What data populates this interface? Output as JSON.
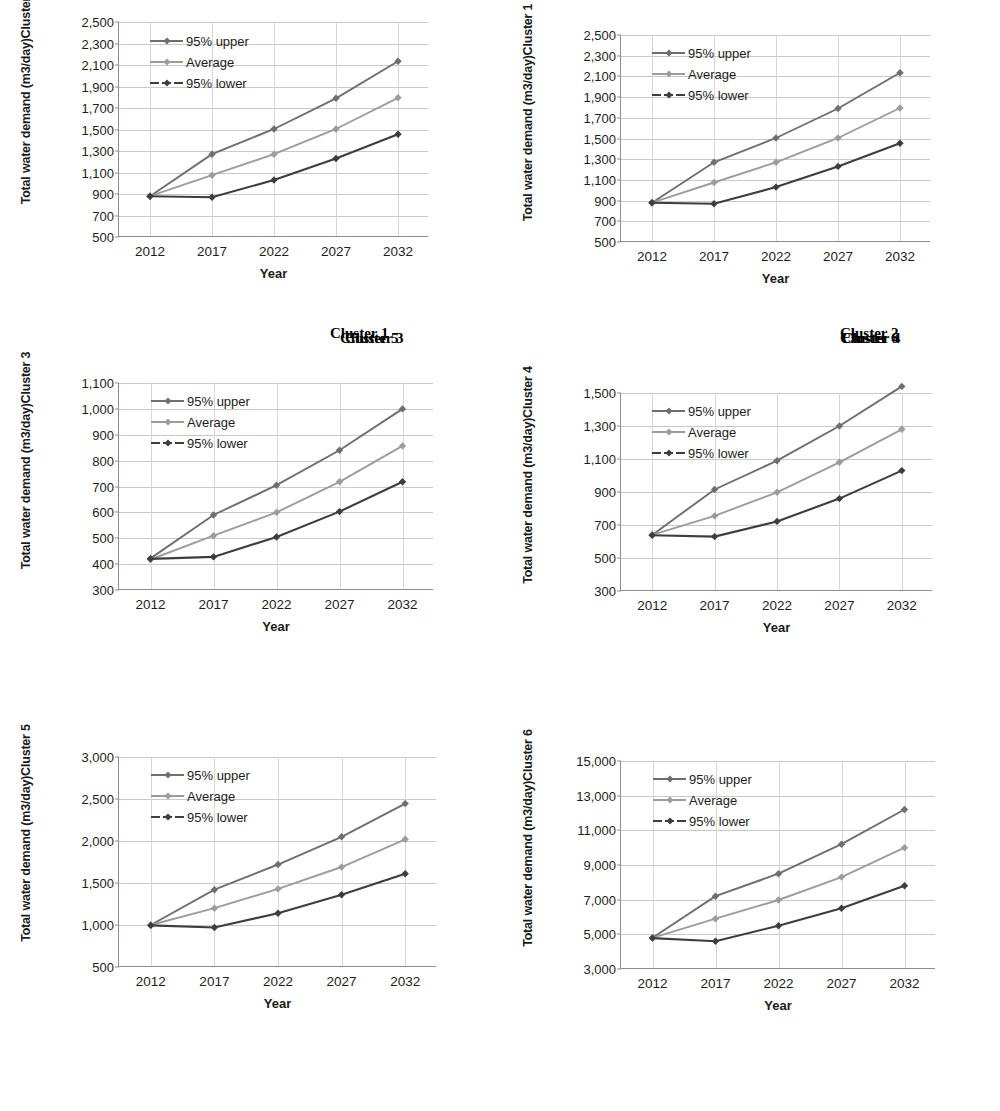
{
  "page": {
    "background": "#ffffff"
  },
  "series_style": {
    "upper_color": "#6e6e6e",
    "average_color": "#9c9c9c",
    "lower_color": "#3d3d3d",
    "gridline_color": "#c9c9c9",
    "axis_color": "#8d8d8d"
  },
  "legend_labels": {
    "upper": "95% upper",
    "average": "Average",
    "lower": "95% lower"
  },
  "axis_titles": {
    "x": "Year",
    "y_prefix": "Total water demand  (m3/day)"
  },
  "chart_data": [
    {
      "id": "chart-1",
      "type": "line",
      "title": "",
      "caption": "Cluster 1",
      "ylabel": "Total water demand  (m3/day)\nCluster 2",
      "ylabel_line1": "Total water demand  (m3/day)",
      "ylabel_line2": "Cluster 2",
      "xlabel": "Year",
      "categories": [
        "2012",
        "2017",
        "2022",
        "2027",
        "2032"
      ],
      "x": [
        2012,
        2017,
        2022,
        2027,
        2032
      ],
      "ylim": [
        500,
        2500
      ],
      "ystep": 200,
      "yticks": [
        "500",
        "700",
        "900",
        "1,100",
        "1,300",
        "1,500",
        "1,700",
        "1,900",
        "2,100",
        "2,300",
        "2,500"
      ],
      "grid": true,
      "legend_position": "top-left",
      "series": [
        {
          "name": "95% upper",
          "values": [
            880,
            1270,
            1505,
            1790,
            2135
          ]
        },
        {
          "name": "Average",
          "values": [
            880,
            1075,
            1270,
            1505,
            1795
          ]
        },
        {
          "name": "95% lower",
          "values": [
            880,
            870,
            1030,
            1230,
            1455
          ]
        }
      ]
    },
    {
      "id": "chart-2",
      "type": "line",
      "title": "",
      "caption": "Cluster 2",
      "ylabel_line1": "Total water demand  (m3/day)",
      "ylabel_line2": "Cluster 1",
      "xlabel": "Year",
      "categories": [
        "2012",
        "2017",
        "2022",
        "2027",
        "2032"
      ],
      "x": [
        2012,
        2017,
        2022,
        2027,
        2032
      ],
      "ylim": [
        500,
        2500
      ],
      "ystep": 200,
      "yticks": [
        "500",
        "700",
        "900",
        "1,100",
        "1,300",
        "1,500",
        "1,700",
        "1,900",
        "2,100",
        "2,300",
        "2,500"
      ],
      "grid": true,
      "legend_position": "top-left",
      "series": [
        {
          "name": "95% upper",
          "values": [
            880,
            1270,
            1505,
            1790,
            2135
          ]
        },
        {
          "name": "Average",
          "values": [
            880,
            1075,
            1270,
            1505,
            1795
          ]
        },
        {
          "name": "95% lower",
          "values": [
            880,
            870,
            1030,
            1230,
            1455
          ]
        }
      ]
    },
    {
      "id": "chart-3",
      "type": "line",
      "title": "",
      "caption": "Cluster 3",
      "ylabel_line1": "Total water demand  (m3/day)",
      "ylabel_line2": "Cluster 3",
      "xlabel": "Year",
      "categories": [
        "2012",
        "2017",
        "2022",
        "2027",
        "2032"
      ],
      "x": [
        2012,
        2017,
        2022,
        2027,
        2032
      ],
      "ylim": [
        300,
        1100
      ],
      "ystep": 100,
      "yticks": [
        "300",
        "400",
        "500",
        "600",
        "700",
        "800",
        "900",
        "1,000",
        "1,100"
      ],
      "grid": true,
      "legend_position": "top-left",
      "series": [
        {
          "name": "95% upper",
          "values": [
            422,
            590,
            705,
            840,
            1000
          ]
        },
        {
          "name": "Average",
          "values": [
            418,
            510,
            600,
            718,
            857
          ]
        },
        {
          "name": "95% lower",
          "values": [
            420,
            428,
            505,
            603,
            718
          ]
        }
      ]
    },
    {
      "id": "chart-4",
      "type": "line",
      "title": "",
      "caption": "Cluster 4",
      "ylabel_line1": "Total water demand  (m3/day)",
      "ylabel_line2": "Cluster 4",
      "xlabel": "Year",
      "categories": [
        "2012",
        "2017",
        "2022",
        "2027",
        "2032"
      ],
      "x": [
        2012,
        2017,
        2022,
        2027,
        2032
      ],
      "ylim": [
        300,
        1500
      ],
      "ystep": 200,
      "yticks": [
        "300",
        "500",
        "700",
        "900",
        "1,100",
        "1,300",
        "1,500"
      ],
      "grid": true,
      "legend_position": "top-left",
      "series": [
        {
          "name": "95% upper",
          "values": [
            640,
            915,
            1090,
            1300,
            1540
          ]
        },
        {
          "name": "Average",
          "values": [
            640,
            755,
            898,
            1080,
            1280
          ]
        },
        {
          "name": "95% lower",
          "values": [
            638,
            630,
            722,
            860,
            1030
          ]
        }
      ]
    },
    {
      "id": "chart-5",
      "type": "line",
      "title": "",
      "caption": "Cluster 5",
      "ylabel_line1": "Total water demand  (m3/day)",
      "ylabel_line2": "Cluster 5",
      "xlabel": "Year",
      "categories": [
        "2012",
        "2017",
        "2022",
        "2027",
        "2032"
      ],
      "x": [
        2012,
        2017,
        2022,
        2027,
        2032
      ],
      "ylim": [
        500,
        3000
      ],
      "ystep": 500,
      "yticks": [
        "500",
        "1,000",
        "1,500",
        "2,000",
        "2,500",
        "3,000"
      ],
      "grid": true,
      "legend_position": "top-left",
      "series": [
        {
          "name": "95% upper",
          "values": [
            1000,
            1420,
            1720,
            2050,
            2445
          ]
        },
        {
          "name": "Average",
          "values": [
            1000,
            1200,
            1430,
            1690,
            2020
          ]
        },
        {
          "name": "95% lower",
          "values": [
            995,
            970,
            1140,
            1360,
            1610
          ]
        }
      ]
    },
    {
      "id": "chart-6",
      "type": "line",
      "title": "",
      "caption": "Cluster 6",
      "ylabel_line1": "Total water demand  (m3/day)",
      "ylabel_line2": "Cluster 6",
      "xlabel": "Year",
      "categories": [
        "2012",
        "2017",
        "2022",
        "2027",
        "2032"
      ],
      "x": [
        2012,
        2017,
        2022,
        2027,
        2032
      ],
      "ylim": [
        3000,
        15000
      ],
      "ystep": 2000,
      "yticks": [
        "3,000",
        "5,000",
        "7,000",
        "9,000",
        "11,000",
        "13,000",
        "15,000"
      ],
      "grid": true,
      "legend_position": "top-left",
      "series": [
        {
          "name": "95% upper",
          "values": [
            4800,
            7200,
            8500,
            10200,
            12200
          ]
        },
        {
          "name": "Average",
          "values": [
            4800,
            5900,
            6980,
            8300,
            10000
          ]
        },
        {
          "name": "95% lower",
          "values": [
            4780,
            4600,
            5500,
            6500,
            7800
          ]
        }
      ]
    }
  ]
}
